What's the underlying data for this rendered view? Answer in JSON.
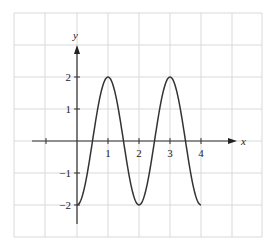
{
  "chart_data": {
    "type": "line",
    "title": "",
    "xlabel": "x",
    "ylabel": "y",
    "xlim": [
      -2,
      5.8
    ],
    "ylim": [
      -2.9,
      4
    ],
    "grid": true,
    "x_ticks": [
      "1",
      "2",
      "3",
      "4"
    ],
    "y_ticks": [
      "2",
      "1",
      "-1",
      "-2"
    ],
    "x_tick_labels_display": [
      "1",
      "2",
      "3",
      "4"
    ],
    "y_tick_labels_display": [
      "2",
      "1",
      "−1",
      "−2"
    ],
    "series": [
      {
        "name": "y = -2cos(πx)",
        "x": [
          0,
          0.5,
          1,
          1.5,
          2,
          2.5,
          3,
          3.5,
          4
        ],
        "y": [
          -2,
          0,
          2,
          0,
          -2,
          0,
          2,
          0,
          -2
        ]
      }
    ],
    "colors": {
      "curve": "#333333",
      "axis": "#333333",
      "grid": "#d9d9d9"
    }
  }
}
